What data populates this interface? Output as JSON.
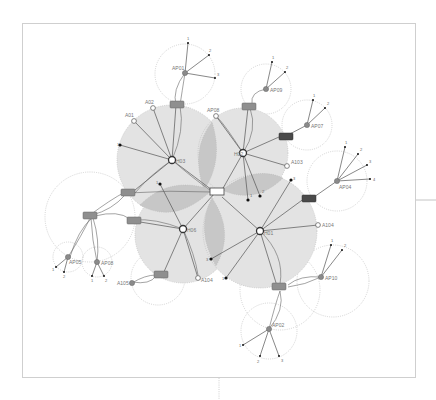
{
  "diagram": {
    "title": "",
    "colors": {
      "zone_fill": "#e3e3e3",
      "overlap_fill": "#c7c7c7",
      "hub_stroke": "#333333",
      "ap_fill": "#8a8a8a",
      "switch_fill": "#8f8f8f",
      "switch_dark_fill": "#4a4a4a",
      "terminal_fill": "#111111",
      "frame_stroke": "#cfcfcf"
    },
    "core": {
      "label": "",
      "x": 216,
      "y": 192
    },
    "hubs": [
      {
        "id": "H03",
        "label": "H03",
        "x": 172,
        "y": 160
      },
      {
        "id": "H02",
        "label": "H02",
        "x": 243,
        "y": 153
      },
      {
        "id": "H06",
        "label": "H06",
        "x": 183,
        "y": 229
      },
      {
        "id": "H01",
        "label": "H01",
        "x": 260,
        "y": 231
      }
    ],
    "access_points": [
      {
        "label": "AP01",
        "x": 185,
        "y": 73,
        "terminals": [
          "1",
          "2",
          "3"
        ]
      },
      {
        "label": "AP09",
        "x": 266,
        "y": 89,
        "terminals": [
          "1",
          "2"
        ]
      },
      {
        "label": "AP07",
        "x": 307,
        "y": 125,
        "terminals": [
          "1",
          "2"
        ]
      },
      {
        "label": "AP04",
        "x": 337,
        "y": 181,
        "terminals": [
          "1",
          "2",
          "3",
          "4"
        ]
      },
      {
        "label": "AP10",
        "x": 321,
        "y": 277,
        "terminals": [
          "1",
          "2"
        ]
      },
      {
        "label": "AP02",
        "x": 269,
        "y": 329,
        "terminals": [
          "1",
          "2",
          "3"
        ]
      },
      {
        "label": "AP05",
        "x": 68,
        "y": 257,
        "terminals": [
          "1",
          "2"
        ]
      },
      {
        "label": "AP08",
        "x": 97,
        "y": 262,
        "terminals": [
          "1",
          "2"
        ]
      }
    ],
    "endpoints": [
      {
        "label": "A02",
        "x": 153,
        "y": 108
      },
      {
        "label": "A01",
        "x": 134,
        "y": 121
      },
      {
        "label": "AP08",
        "x": 216,
        "y": 116
      },
      {
        "label": "A103",
        "x": 287,
        "y": 166
      },
      {
        "label": "A104",
        "x": 318,
        "y": 225
      },
      {
        "label": "A104",
        "x": 198,
        "y": 278
      },
      {
        "label": "A105",
        "x": 132,
        "y": 283
      }
    ],
    "terminal_labels": {
      "h03_left": "1",
      "h02_bottom_1": "1",
      "h02_bottom_2": "2",
      "h01_top": "3",
      "h06_top": "1",
      "h01_left": "3",
      "h01_bottom": "1"
    }
  }
}
